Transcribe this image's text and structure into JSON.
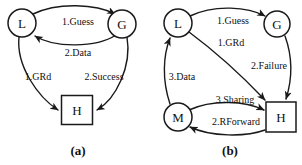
{
  "figure": {
    "background_color": "#ffffff",
    "ink_color": "#1a1a1a",
    "panels": [
      {
        "id": "panel-a",
        "caption": "(a)",
        "caption_x": 78,
        "caption_y": 150,
        "nodes": [
          {
            "id": "a-L",
            "label": "L",
            "shape": "circle",
            "cx": 22,
            "cy": 23,
            "r": 14
          },
          {
            "id": "a-G",
            "label": "G",
            "shape": "circle",
            "cx": 122,
            "cy": 24,
            "r": 14
          },
          {
            "id": "a-H",
            "label": "H",
            "shape": "rect",
            "cx": 77,
            "cy": 110,
            "w": 31,
            "h": 29
          }
        ],
        "edges": [
          {
            "id": "a-e1",
            "from": "a-L",
            "to": "a-G",
            "label": "1.Guess",
            "label_x": 78,
            "label_y": 21
          },
          {
            "id": "a-e2",
            "from": "a-G",
            "to": "a-L",
            "label": "2.Data",
            "label_x": 78,
            "label_y": 52
          },
          {
            "id": "a-e3",
            "from": "a-L",
            "to": "a-H",
            "label": "1.GRd",
            "label_x": 38,
            "label_y": 76
          },
          {
            "id": "a-e4",
            "from": "a-G",
            "to": "a-H",
            "label": "2.Success",
            "label_x": 104,
            "label_y": 76
          }
        ]
      },
      {
        "id": "panel-b",
        "caption": "(b)",
        "caption_x": 230,
        "caption_y": 150,
        "nodes": [
          {
            "id": "b-L",
            "label": "L",
            "shape": "circle",
            "cx": 178,
            "cy": 23,
            "r": 14
          },
          {
            "id": "b-G",
            "label": "G",
            "shape": "circle",
            "cx": 277,
            "cy": 24,
            "r": 13
          },
          {
            "id": "b-M",
            "label": "M",
            "shape": "circle",
            "cx": 178,
            "cy": 117,
            "r": 14
          },
          {
            "id": "b-H",
            "label": "H",
            "shape": "rect",
            "cx": 281,
            "cy": 117,
            "w": 30,
            "h": 30
          }
        ],
        "edges": [
          {
            "id": "b-e1",
            "from": "b-L",
            "to": "b-G",
            "label": "1.Guess",
            "label_x": 233,
            "label_y": 20
          },
          {
            "id": "b-e2",
            "from": "b-L",
            "to": "b-H",
            "label": "1.GRd",
            "label_x": 231,
            "label_y": 42
          },
          {
            "id": "b-e3",
            "from": "b-G",
            "to": "b-H",
            "label": "2.Failure",
            "label_x": 269,
            "label_y": 65
          },
          {
            "id": "b-e4",
            "from": "b-M",
            "to": "b-L",
            "label": "3.Data",
            "label_x": 182,
            "label_y": 76
          },
          {
            "id": "b-e5",
            "from": "b-M",
            "to": "b-H",
            "label": "3.Sharing",
            "label_x": 235,
            "label_y": 99
          },
          {
            "id": "b-e6",
            "from": "b-H",
            "to": "b-M",
            "label": "2.RForward",
            "label_x": 236,
            "label_y": 121
          }
        ]
      }
    ]
  }
}
